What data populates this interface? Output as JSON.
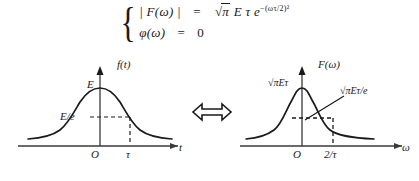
{
  "figure": {
    "equations": {
      "brace": "{",
      "line1": {
        "lhs": "| F(ω) |",
        "eq": "=",
        "rhs_sqrt": "π",
        "rhs_rest": "E τ e",
        "exponent": "−(ωτ/2)²"
      },
      "line2": {
        "lhs": "φ(ω)",
        "eq": "=",
        "rhs": "0"
      }
    },
    "relation_symbol": "⟺",
    "left_graph": {
      "name": "time-domain-gaussian",
      "y_axis_label": "f(t)",
      "x_axis_label": "t",
      "origin_label": "O",
      "peak_label": "E",
      "level_label": "E/e",
      "x_tick_label": "τ",
      "curve_type": "gaussian",
      "dashed_guides": [
        "horizontal-at-E/e",
        "vertical-at-tau"
      ]
    },
    "right_graph": {
      "name": "frequency-domain-gaussian",
      "y_axis_label": "F(ω)",
      "x_axis_label": "ω",
      "origin_label": "O",
      "peak_label": "√πEτ",
      "annotation_label": "√πEτ/e",
      "x_tick_label": "2/τ",
      "curve_type": "gaussian",
      "dashed_guides": [
        "horizontal-at-peak/e",
        "vertical-at-2-over-tau"
      ],
      "leader_line": true
    },
    "colors": {
      "ink": "#1a1a1a",
      "axis": "#3a3a3a",
      "background": "#ffffff"
    }
  }
}
